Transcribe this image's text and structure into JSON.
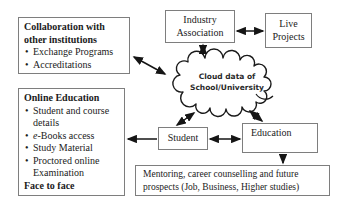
{
  "bullet_char": "•",
  "collaboration": {
    "title": "Collaboration with other institutions",
    "bullets": [
      {
        "text": "Exchange Programs"
      },
      {
        "text": "Accreditations"
      }
    ]
  },
  "online_education": {
    "title": "Online Education",
    "bullets": [
      {
        "text": "Student and course details"
      },
      {
        "text": "e-Books access"
      },
      {
        "text": "Study Material"
      },
      {
        "text": "Proctored online Examination"
      }
    ],
    "footer": "Face to face"
  },
  "industry_association": {
    "label": "Industry Association"
  },
  "live_projects": {
    "label": "Live Projects"
  },
  "cloud": {
    "line1": "Cloud data of",
    "line2": "School/University"
  },
  "student": {
    "label": "Student"
  },
  "education": {
    "label": "Education"
  },
  "mentoring": {
    "label": "Mentoring, career counselling and future prospects (Job, Business, Higher studies)"
  },
  "colors": {
    "box_border": "#7e7e7e",
    "text": "#1b1b1b",
    "arrow": "#151515"
  }
}
